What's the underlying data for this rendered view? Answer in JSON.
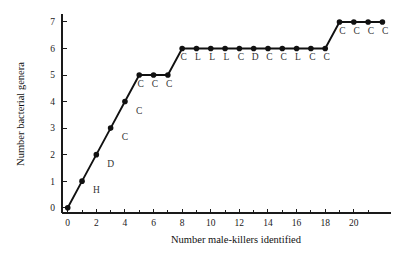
{
  "figure": {
    "background_color": "#ffffff",
    "line_color": "#111111",
    "marker_color": "#111111",
    "axis_color": "#1a1a1a",
    "annotation_color": "#333333"
  },
  "chart_data": {
    "type": "line",
    "title": "",
    "subtitle": "",
    "xlabel": "Number male-killers identified",
    "ylabel": "Number bacterial genera",
    "xlim": [
      -0.4,
      22.6
    ],
    "ylim": [
      -0.2,
      7.3
    ],
    "xticks": [
      0,
      2,
      4,
      6,
      8,
      10,
      12,
      14,
      16,
      18,
      20
    ],
    "xtick_labels": [
      "0",
      "2",
      "4",
      "6",
      "8",
      "10",
      "12",
      "14",
      "16",
      "18",
      "20"
    ],
    "xminor_ticks": [
      1,
      3,
      5,
      7,
      9,
      11,
      13,
      15,
      17,
      19,
      21
    ],
    "yticks": [
      0,
      1,
      2,
      3,
      4,
      5,
      6,
      7
    ],
    "ytick_labels": [
      "0",
      "1",
      "2",
      "3",
      "4",
      "5",
      "6",
      "7"
    ],
    "grid": false,
    "legend": null,
    "marker": "filled-circle",
    "x": [
      0,
      1,
      2,
      3,
      4,
      5,
      6,
      7,
      8,
      9,
      10,
      11,
      12,
      13,
      14,
      15,
      16,
      17,
      18,
      19,
      20,
      21,
      22
    ],
    "y": [
      0,
      1,
      2,
      3,
      4,
      5,
      5,
      5,
      6,
      6,
      6,
      6,
      6,
      6,
      6,
      6,
      6,
      6,
      6,
      7,
      7,
      7,
      7
    ],
    "series": [
      {
        "name": "Bacterial genera accumulation",
        "values": [
          0,
          1,
          2,
          3,
          4,
          5,
          5,
          5,
          6,
          6,
          6,
          6,
          6,
          6,
          6,
          6,
          6,
          6,
          6,
          7,
          7,
          7,
          7
        ]
      }
    ],
    "annotations": [
      {
        "text": "H",
        "x": 2.0,
        "y": 0.55
      },
      {
        "text": "D",
        "x": 3.0,
        "y": 1.55
      },
      {
        "text": "C",
        "x": 4.0,
        "y": 2.55
      },
      {
        "text": "C",
        "x": 5.0,
        "y": 3.55
      },
      {
        "text": "C",
        "x": 5.1,
        "y": 4.55
      },
      {
        "text": "C",
        "x": 6.1,
        "y": 4.55
      },
      {
        "text": "C",
        "x": 7.1,
        "y": 4.55
      },
      {
        "text": "C",
        "x": 8.1,
        "y": 5.55
      },
      {
        "text": "L",
        "x": 9.1,
        "y": 5.55
      },
      {
        "text": "L",
        "x": 10.1,
        "y": 5.55
      },
      {
        "text": "L",
        "x": 11.1,
        "y": 5.55
      },
      {
        "text": "C",
        "x": 12.1,
        "y": 5.55
      },
      {
        "text": "D",
        "x": 13.1,
        "y": 5.55
      },
      {
        "text": "C",
        "x": 14.1,
        "y": 5.55
      },
      {
        "text": "C",
        "x": 15.1,
        "y": 5.55
      },
      {
        "text": "L",
        "x": 16.1,
        "y": 5.55
      },
      {
        "text": "C",
        "x": 17.1,
        "y": 5.55
      },
      {
        "text": "C",
        "x": 18.1,
        "y": 5.55
      },
      {
        "text": "C",
        "x": 19.2,
        "y": 6.55
      },
      {
        "text": "C",
        "x": 20.2,
        "y": 6.55
      },
      {
        "text": "C",
        "x": 21.2,
        "y": 6.55
      },
      {
        "text": "C",
        "x": 22.2,
        "y": 6.55
      }
    ]
  }
}
